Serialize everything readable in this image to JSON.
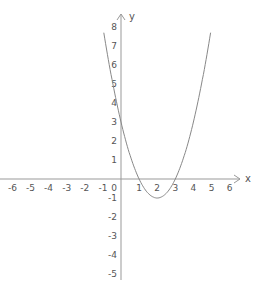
{
  "chart_data": {
    "type": "line",
    "title": "",
    "function": "y = x^2 - 4x + 3",
    "xlabel": "x",
    "ylabel": "y",
    "xlim": [
      -6.5,
      6.5
    ],
    "ylim": [
      -5.5,
      8.5
    ],
    "grid": false,
    "x_ticks": [
      -6,
      -5,
      -4,
      -3,
      -2,
      -1,
      0,
      1,
      2,
      3,
      4,
      5,
      6
    ],
    "y_ticks": [
      -5,
      -4,
      -3,
      -2,
      -1,
      1,
      2,
      3,
      4,
      5,
      6,
      7,
      8
    ],
    "series": [
      {
        "name": "parabola",
        "x": [
          -0.9,
          -0.5,
          0,
          0.5,
          1,
          1.5,
          2,
          2.5,
          3,
          3.5,
          4,
          4.5,
          4.9
        ],
        "y": [
          7.41,
          5.25,
          3,
          1.25,
          0,
          -0.75,
          -1,
          -0.75,
          0,
          1.25,
          3,
          5.25,
          7.41
        ]
      }
    ],
    "key_points": {
      "roots": [
        1,
        3
      ],
      "vertex": [
        2,
        -1
      ],
      "y_intercept": 3
    },
    "origin_label": "0",
    "color": "#888888"
  }
}
